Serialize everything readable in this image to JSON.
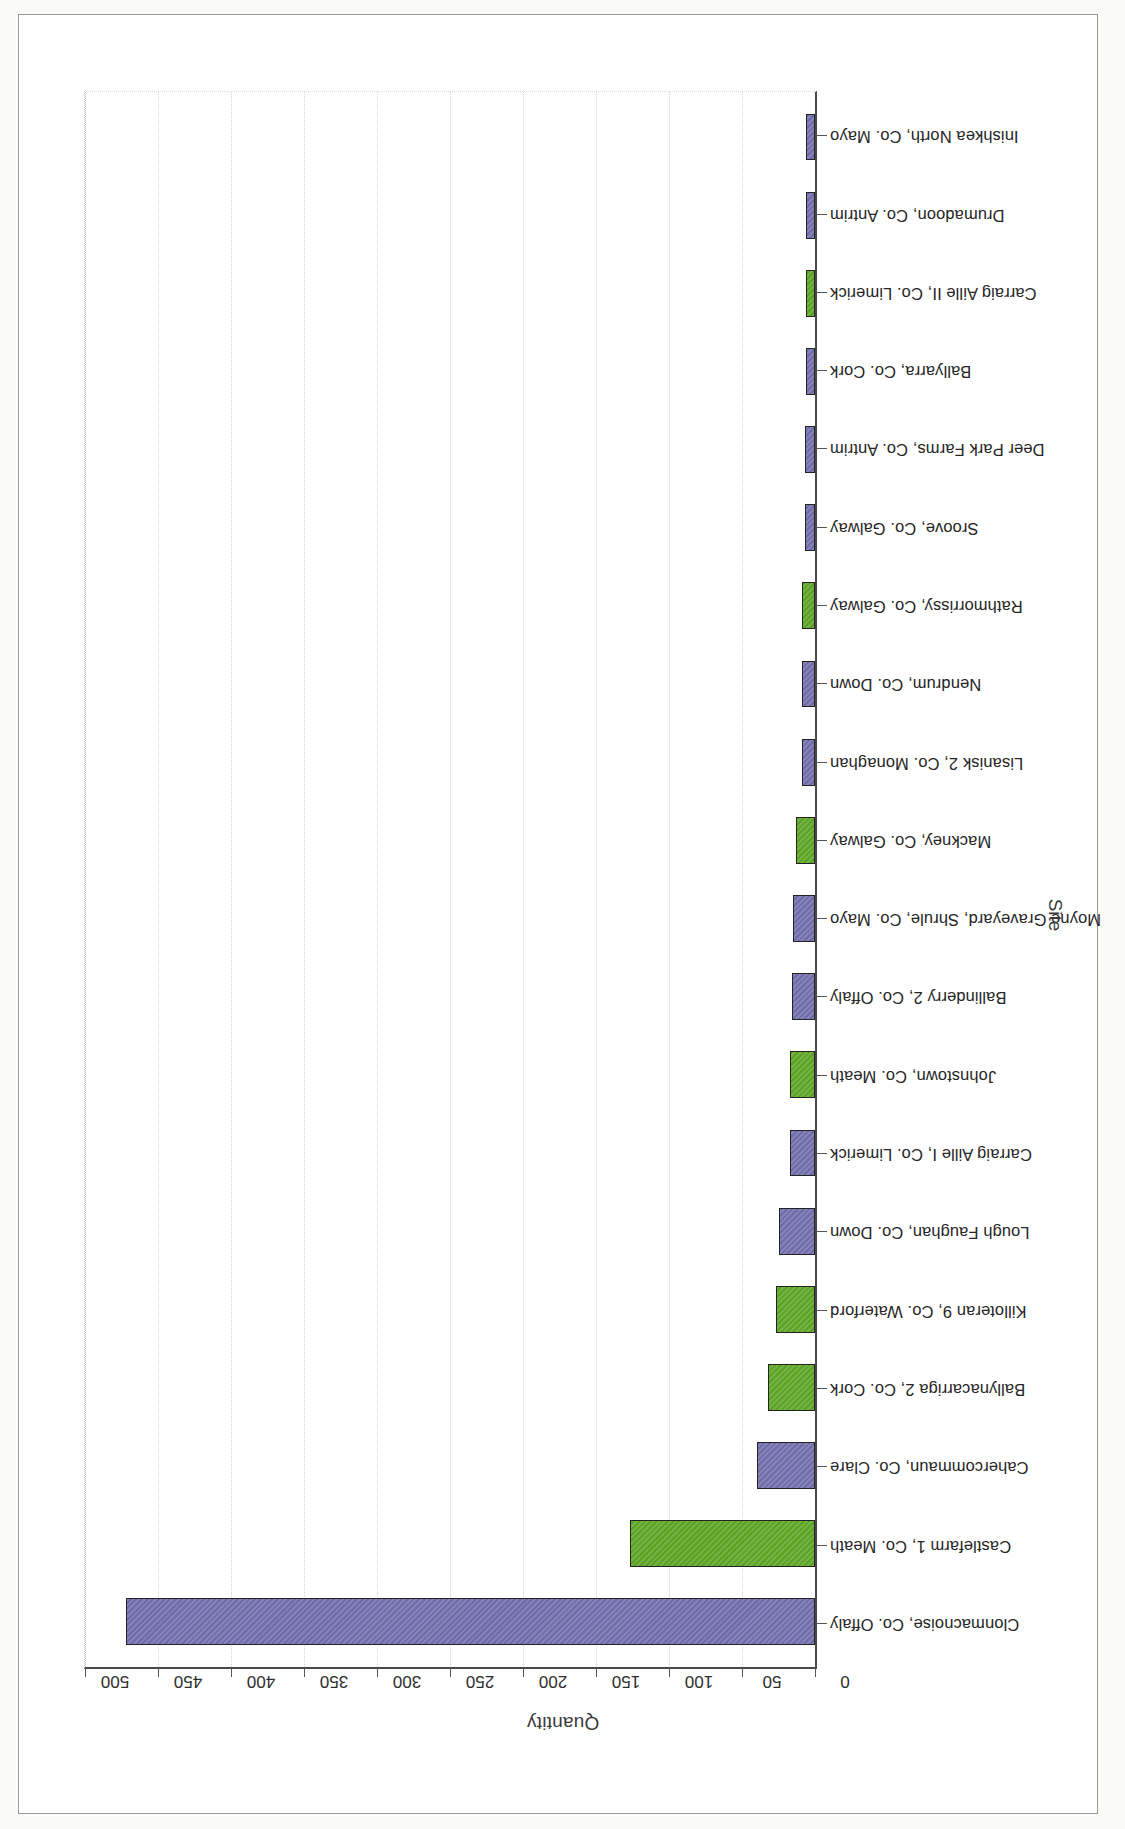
{
  "figure": {
    "orientation_note": "rotated-90-ccw-on-page"
  },
  "chart_data": {
    "type": "bar",
    "title": "",
    "xlabel": "Site",
    "ylabel": "Quantity",
    "ylim": [
      0,
      500
    ],
    "yticks": [
      0,
      50,
      100,
      150,
      200,
      250,
      300,
      350,
      400,
      450,
      500
    ],
    "ytick_labels": [
      "0",
      "50",
      "100",
      "150",
      "200",
      "250",
      "300",
      "350",
      "400",
      "450",
      "500"
    ],
    "grid": true,
    "legend": "none",
    "colors": {
      "purple": "#6f6bab",
      "green": "#5aa221",
      "bar_outline": "#232323"
    },
    "categories": [
      "Clonmacnoise, Co. Offaly",
      "Castlefarm 1, Co. Meath",
      "Cahercommaun, Co. Clare",
      "Ballynacarriga 2, Co. Cork",
      "Killoteran 9, Co. Waterford",
      "Lough Faughan, Co. Down",
      "Carraig Aille I, Co. Limerick",
      "Johnstown, Co. Meath",
      "Ballinderry 2, Co. Offaly",
      "Moyne Graveyard, Shrule, Co. Mayo",
      "Mackney, Co. Galway",
      "Lisanisk 2, Co. Monaghan",
      "Nendrum, Co. Down",
      "Rathmorrissy, Co. Galway",
      "Sroove, Co. Galway",
      "Deer Park Farms, Co. Antrim",
      "Ballyarra, Co. Cork",
      "Carraig Aille II, Co. Limerick",
      "Drumadoon, Co. Antrim",
      "Inishkea North, Co. Mayo"
    ],
    "values": [
      472,
      127,
      40,
      32,
      27,
      25,
      17,
      17,
      16,
      15,
      13,
      9,
      9,
      9,
      7,
      7,
      6,
      6,
      6,
      6
    ],
    "bar_colors": [
      "purple",
      "green",
      "purple",
      "green",
      "green",
      "purple",
      "purple",
      "green",
      "purple",
      "purple",
      "green",
      "purple",
      "purple",
      "green",
      "purple",
      "purple",
      "purple",
      "green",
      "purple",
      "purple"
    ]
  }
}
